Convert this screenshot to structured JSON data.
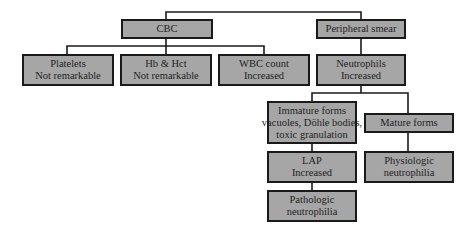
{
  "diagram": {
    "type": "flowchart",
    "colors": {
      "box_fill": "#a6a6a6",
      "box_border": "#1a1a1a",
      "line": "#1a1a1a",
      "text": "#1e1e1e"
    },
    "nodes": {
      "cbc": {
        "lines": [
          "CBC"
        ]
      },
      "peripheral_smear": {
        "lines": [
          "Peripheral smear"
        ]
      },
      "platelets": {
        "lines": [
          "Platelets",
          "Not remarkable"
        ]
      },
      "hb_hct": {
        "lines": [
          "Hb & Hct",
          "Not remarkable"
        ]
      },
      "wbc_count": {
        "lines": [
          "WBC count",
          "Increased"
        ]
      },
      "neutrophils": {
        "lines": [
          "Neutrophils",
          "Increased"
        ]
      },
      "immature_forms": {
        "lines": [
          "Immature forms",
          "vacuoles, Döhle bodies,",
          "toxic granulation"
        ]
      },
      "mature_forms": {
        "lines": [
          "Mature forms"
        ]
      },
      "lap": {
        "lines": [
          "LAP",
          "Increased"
        ]
      },
      "physiologic": {
        "lines": [
          "Physiologic",
          "neutrophilia"
        ]
      },
      "pathologic": {
        "lines": [
          "Pathologic",
          "neutrophilia"
        ]
      }
    },
    "edges": [
      [
        "root",
        "cbc"
      ],
      [
        "root",
        "peripheral_smear"
      ],
      [
        "cbc",
        "platelets"
      ],
      [
        "cbc",
        "hb_hct"
      ],
      [
        "cbc",
        "wbc_count"
      ],
      [
        "peripheral_smear",
        "neutrophils"
      ],
      [
        "neutrophils",
        "immature_forms"
      ],
      [
        "neutrophils",
        "mature_forms"
      ],
      [
        "immature_forms",
        "lap"
      ],
      [
        "lap",
        "pathologic"
      ],
      [
        "mature_forms",
        "physiologic"
      ]
    ]
  }
}
